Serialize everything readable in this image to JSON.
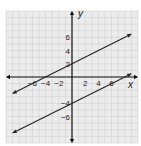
{
  "chart_data": {
    "type": "line",
    "title": "",
    "xlabel": "x",
    "ylabel": "y",
    "xlim": [
      -10,
      10
    ],
    "ylim": [
      -10,
      10
    ],
    "grid": true,
    "x_ticks": [
      "−6",
      "−4",
      "−2",
      "2",
      "4",
      "6"
    ],
    "y_ticks": [
      "6",
      "4",
      "2",
      "−4",
      "−6"
    ],
    "series": [
      {
        "name": "line1",
        "equation": "y = 0.5x + 2",
        "points": [
          [
            -9,
            -2.5
          ],
          [
            9,
            6.5
          ]
        ]
      },
      {
        "name": "line2",
        "equation": "y = 0.5x - 4",
        "points": [
          [
            -9,
            -8.5
          ],
          [
            9,
            0.5
          ]
        ]
      }
    ],
    "colors": {
      "grid": "#d0d0d0",
      "background": "#ececec",
      "line": "#222222"
    }
  },
  "labels": {
    "x_axis": "x",
    "y_axis": "y"
  }
}
